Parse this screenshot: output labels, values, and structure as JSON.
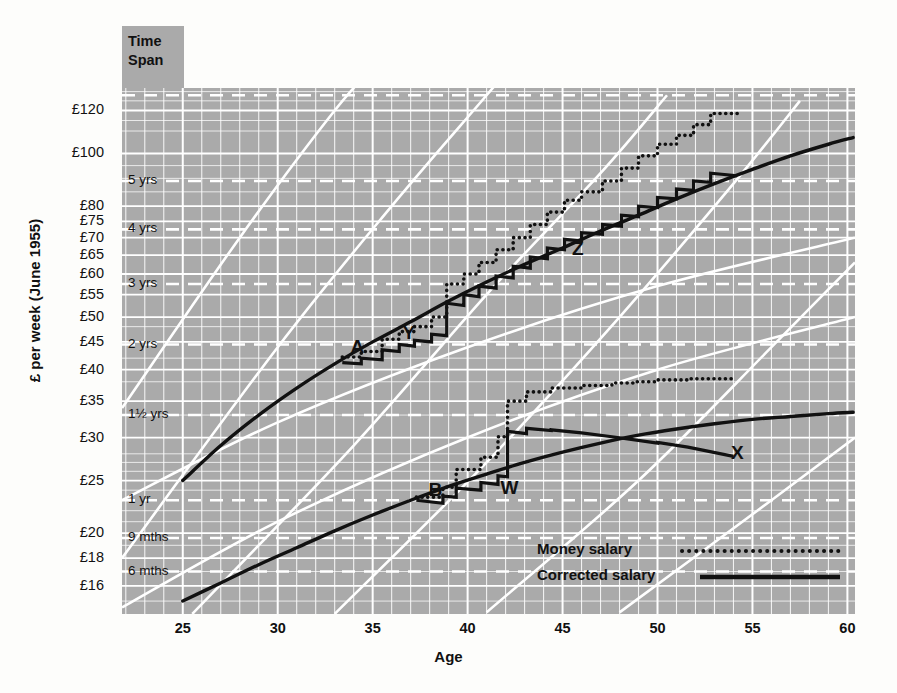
{
  "figure": {
    "time_span_header": "Time\nSpan",
    "time_span_line1": "Time",
    "time_span_line2": "Span"
  },
  "chart_data": {
    "type": "line",
    "title": "",
    "xlabel": "Age",
    "ylabel": "£ per week (June 1955)",
    "xlim": [
      21.8,
      60.4
    ],
    "ylim_pounds": [
      14.2,
      132
    ],
    "yscale": "log",
    "grid": true,
    "legend_position": "bottom-right",
    "x_ticks": [
      25,
      30,
      35,
      40,
      45,
      50,
      55,
      60
    ],
    "x_tick_labels": [
      "25",
      "30",
      "35",
      "40",
      "45",
      "50",
      "55",
      "60"
    ],
    "y_ticks_pounds": [
      120,
      100,
      80,
      75,
      70,
      65,
      60,
      55,
      50,
      45,
      40,
      35,
      30,
      25,
      20,
      18,
      16
    ],
    "y_tick_labels": [
      "£120",
      "£100",
      "£80",
      "£75",
      "£70",
      "£65",
      "£60",
      "£55",
      "£50",
      "£45",
      "£40",
      "£35",
      "£30",
      "£25",
      "£20",
      "£18",
      "£16"
    ],
    "time_span_gridlines": [
      {
        "label": "5 yrs",
        "pounds": 89.0
      },
      {
        "label": "4 yrs",
        "pounds": 72.5
      },
      {
        "label": "3 yrs",
        "pounds": 57.5
      },
      {
        "label": "2 yrs",
        "pounds": 44.5
      },
      {
        "label": "1½ yrs",
        "pounds": 33.0
      },
      {
        "label": "1 yr",
        "pounds": 23.0
      },
      {
        "label": "9 mths",
        "pounds": 19.6
      },
      {
        "label": "6 mths",
        "pounds": 17.0
      }
    ],
    "legend": [
      {
        "name": "Money salary",
        "style": "dotted"
      },
      {
        "name": "Corrected salary",
        "style": "solid"
      }
    ],
    "annotations": [
      {
        "label": "A",
        "age": 34.2,
        "pounds": 43.0
      },
      {
        "label": "Y",
        "age": 36.9,
        "pounds": 45.5
      },
      {
        "label": "Z",
        "age": 45.8,
        "pounds": 65.0
      },
      {
        "label": "B",
        "age": 38.3,
        "pounds": 23.4
      },
      {
        "label": "W",
        "age": 42.2,
        "pounds": 23.6
      },
      {
        "label": "X",
        "age": 54.2,
        "pounds": 27.4
      }
    ],
    "series": [
      {
        "name": "Career progress band A (upper smooth curve)",
        "style": "solid-smooth",
        "points": [
          [
            25.0,
            25.0
          ],
          [
            27.0,
            29.0
          ],
          [
            29.0,
            33.0
          ],
          [
            31.0,
            37.0
          ],
          [
            33.0,
            41.0
          ],
          [
            35.0,
            45.0
          ],
          [
            37.0,
            49.0
          ],
          [
            39.0,
            53.5
          ],
          [
            41.0,
            58.0
          ],
          [
            43.0,
            62.5
          ],
          [
            45.0,
            67.0
          ],
          [
            47.0,
            72.0
          ],
          [
            49.0,
            77.0
          ],
          [
            51.0,
            82.5
          ],
          [
            53.0,
            88.0
          ],
          [
            55.0,
            93.5
          ],
          [
            57.0,
            99.0
          ],
          [
            59.0,
            104.0
          ],
          [
            60.3,
            107.0
          ]
        ]
      },
      {
        "name": "Career progress band B (lower smooth curve)",
        "style": "solid-smooth",
        "points": [
          [
            25.0,
            15.0
          ],
          [
            27.0,
            16.2
          ],
          [
            29.0,
            17.5
          ],
          [
            31.0,
            18.8
          ],
          [
            33.0,
            20.2
          ],
          [
            35.0,
            21.6
          ],
          [
            37.0,
            23.0
          ],
          [
            39.0,
            24.4
          ],
          [
            41.0,
            25.7
          ],
          [
            43.0,
            27.0
          ],
          [
            45.0,
            28.2
          ],
          [
            47.0,
            29.3
          ],
          [
            49.0,
            30.3
          ],
          [
            51.0,
            31.1
          ],
          [
            53.0,
            31.8
          ],
          [
            55.0,
            32.4
          ],
          [
            57.0,
            32.8
          ],
          [
            59.0,
            33.2
          ],
          [
            60.3,
            33.4
          ]
        ]
      },
      {
        "name": "Money salary - upper career (A/Y/Z)",
        "style": "dotted-step",
        "points": [
          [
            33.4,
            42.2
          ],
          [
            34.4,
            42.2
          ],
          [
            34.4,
            43.2
          ],
          [
            35.5,
            43.2
          ],
          [
            35.5,
            45.5
          ],
          [
            36.4,
            45.5
          ],
          [
            36.4,
            47.0
          ],
          [
            37.2,
            47.0
          ],
          [
            37.2,
            48.0
          ],
          [
            38.1,
            48.0
          ],
          [
            38.1,
            50.0
          ],
          [
            38.9,
            50.0
          ],
          [
            38.9,
            57.5
          ],
          [
            39.8,
            57.5
          ],
          [
            39.8,
            60.0
          ],
          [
            40.6,
            60.0
          ],
          [
            40.6,
            63.0
          ],
          [
            41.5,
            63.0
          ],
          [
            41.5,
            66.5
          ],
          [
            42.4,
            66.5
          ],
          [
            42.4,
            70.0
          ],
          [
            43.3,
            70.0
          ],
          [
            43.3,
            74.0
          ],
          [
            44.2,
            74.0
          ],
          [
            44.2,
            78.0
          ],
          [
            45.1,
            78.0
          ],
          [
            45.1,
            82.0
          ],
          [
            46.0,
            82.0
          ],
          [
            46.0,
            85.0
          ],
          [
            47.1,
            85.0
          ],
          [
            47.1,
            89.0
          ],
          [
            48.1,
            89.0
          ],
          [
            48.1,
            94.0
          ],
          [
            49.0,
            94.0
          ],
          [
            49.0,
            99.0
          ],
          [
            50.0,
            99.0
          ],
          [
            50.0,
            104.0
          ],
          [
            51.0,
            104.0
          ],
          [
            51.0,
            108.0
          ],
          [
            51.9,
            108.0
          ],
          [
            51.9,
            113.0
          ],
          [
            52.8,
            113.0
          ],
          [
            52.8,
            118.5
          ],
          [
            54.2,
            118.5
          ]
        ]
      },
      {
        "name": "Corrected salary - upper career (A/Y/Z)",
        "style": "solid-step",
        "points": [
          [
            33.4,
            41.2
          ],
          [
            34.4,
            41.0
          ],
          [
            34.4,
            42.0
          ],
          [
            35.5,
            41.7
          ],
          [
            35.5,
            43.5
          ],
          [
            36.4,
            43.2
          ],
          [
            36.4,
            44.5
          ],
          [
            37.2,
            44.2
          ],
          [
            37.2,
            45.3
          ],
          [
            38.1,
            45.0
          ],
          [
            38.1,
            46.5
          ],
          [
            38.9,
            46.2
          ],
          [
            38.9,
            53.0
          ],
          [
            39.8,
            52.5
          ],
          [
            39.8,
            55.0
          ],
          [
            40.6,
            54.5
          ],
          [
            40.6,
            57.0
          ],
          [
            41.5,
            56.5
          ],
          [
            41.5,
            59.5
          ],
          [
            42.4,
            59.0
          ],
          [
            42.4,
            62.0
          ],
          [
            43.3,
            61.5
          ],
          [
            43.3,
            64.5
          ],
          [
            44.2,
            64.0
          ],
          [
            44.2,
            67.0
          ],
          [
            45.1,
            66.5
          ],
          [
            45.1,
            69.5
          ],
          [
            46.0,
            69.0
          ],
          [
            46.0,
            71.5
          ],
          [
            47.1,
            71.0
          ],
          [
            47.1,
            74.0
          ],
          [
            48.1,
            73.5
          ],
          [
            48.1,
            77.0
          ],
          [
            49.0,
            76.5
          ],
          [
            49.0,
            80.0
          ],
          [
            50.0,
            79.5
          ],
          [
            50.0,
            83.0
          ],
          [
            51.0,
            82.5
          ],
          [
            51.0,
            86.0
          ],
          [
            51.9,
            85.5
          ],
          [
            51.9,
            89.0
          ],
          [
            52.8,
            88.5
          ],
          [
            52.8,
            92.0
          ],
          [
            54.2,
            91.0
          ]
        ]
      },
      {
        "name": "Money salary - lower career (B/W/X)",
        "style": "dotted-step",
        "points": [
          [
            37.3,
            23.3
          ],
          [
            38.7,
            23.3
          ],
          [
            38.7,
            24.3
          ],
          [
            39.4,
            24.3
          ],
          [
            39.4,
            26.2
          ],
          [
            40.7,
            26.2
          ],
          [
            40.7,
            27.6
          ],
          [
            41.6,
            27.6
          ],
          [
            41.6,
            30.1
          ],
          [
            42.1,
            30.1
          ],
          [
            42.1,
            35.0
          ],
          [
            43.1,
            35.0
          ],
          [
            43.1,
            36.4
          ],
          [
            44.4,
            36.4
          ],
          [
            44.4,
            37.0
          ],
          [
            46.0,
            37.0
          ],
          [
            46.0,
            37.4
          ],
          [
            47.6,
            37.4
          ],
          [
            47.6,
            37.8
          ],
          [
            48.8,
            37.8
          ],
          [
            48.8,
            38.0
          ],
          [
            50.0,
            38.0
          ],
          [
            50.0,
            38.3
          ],
          [
            51.6,
            38.3
          ],
          [
            51.6,
            38.5
          ],
          [
            54.0,
            38.5
          ]
        ]
      },
      {
        "name": "Corrected salary - lower career (B/W/X)",
        "style": "solid-step",
        "points": [
          [
            37.3,
            23.0
          ],
          [
            38.7,
            22.7
          ],
          [
            38.7,
            23.4
          ],
          [
            39.4,
            23.3
          ],
          [
            39.4,
            24.2
          ],
          [
            40.7,
            24.0
          ],
          [
            40.7,
            24.8
          ],
          [
            41.6,
            24.6
          ],
          [
            41.6,
            25.5
          ],
          [
            42.1,
            25.4
          ],
          [
            42.1,
            30.8
          ],
          [
            43.1,
            30.5
          ],
          [
            43.1,
            31.2
          ],
          [
            44.4,
            30.9
          ],
          [
            44.4,
            31.0
          ],
          [
            46.0,
            30.6
          ],
          [
            46.0,
            30.6
          ],
          [
            47.6,
            30.1
          ],
          [
            47.6,
            30.1
          ],
          [
            48.8,
            29.7
          ],
          [
            48.8,
            29.7
          ],
          [
            50.0,
            29.3
          ],
          [
            50.0,
            29.4
          ],
          [
            51.6,
            28.8
          ],
          [
            51.6,
            28.8
          ],
          [
            54.0,
            27.7
          ]
        ]
      }
    ]
  }
}
